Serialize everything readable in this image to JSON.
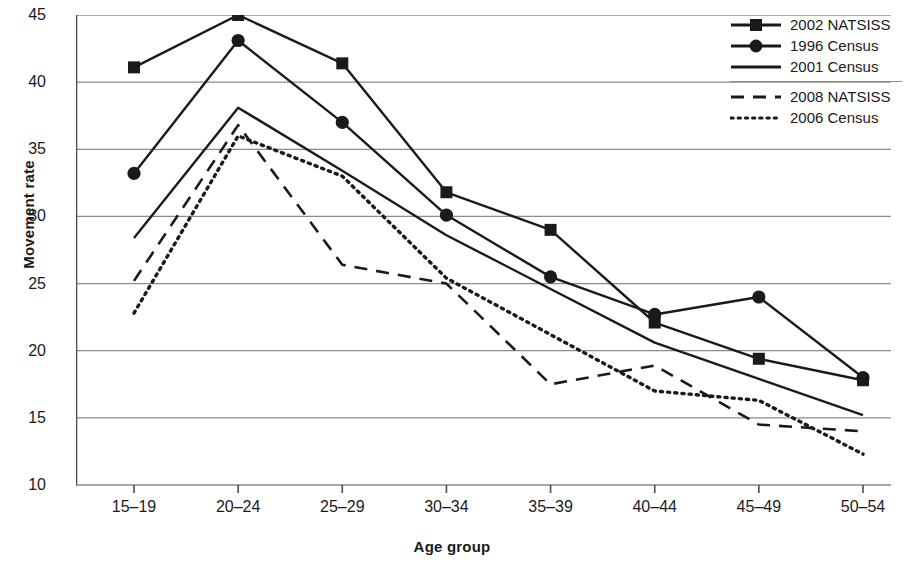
{
  "chart_data": {
    "type": "line",
    "title": "",
    "xlabel": "Age group",
    "ylabel": "Movement rate",
    "categories": [
      "15–19",
      "20–24",
      "25–29",
      "30–34",
      "35–39",
      "40–44",
      "45–49",
      "50–54"
    ],
    "ylim": [
      10,
      45
    ],
    "yticks": [
      10,
      15,
      20,
      25,
      30,
      35,
      40,
      45
    ],
    "grid": true,
    "legend_position": "top-right",
    "series": [
      {
        "name": "2002 NATSISS",
        "marker": "square",
        "dash": "solid",
        "values": [
          41.1,
          45.0,
          41.4,
          31.8,
          29.0,
          22.1,
          19.4,
          17.8
        ]
      },
      {
        "name": "1996 Census",
        "marker": "circle",
        "dash": "solid",
        "values": [
          33.2,
          43.1,
          37.0,
          30.1,
          25.5,
          22.7,
          24.0,
          18.0
        ]
      },
      {
        "name": "2001 Census",
        "marker": "none",
        "dash": "solid",
        "values": [
          28.4,
          38.1,
          33.4,
          28.6,
          24.6,
          20.6,
          17.9,
          15.2
        ]
      },
      {
        "name": "2008 NATSISS",
        "marker": "none",
        "dash": "dashed",
        "values": [
          25.2,
          36.8,
          26.4,
          25.0,
          17.5,
          18.9,
          14.5,
          14.0
        ]
      },
      {
        "name": "2006 Census",
        "marker": "none",
        "dash": "dotted",
        "values": [
          22.8,
          36.0,
          33.0,
          25.4,
          21.2,
          17.0,
          16.3,
          12.3
        ]
      }
    ]
  },
  "legend": {
    "groups": [
      {
        "items": [
          "2002 NATSISS",
          "1996 Census",
          "2001 Census"
        ]
      },
      {
        "items": [
          "2008 NATSISS",
          "2006 Census"
        ]
      }
    ]
  },
  "axis": {
    "y_title": "Movement rate",
    "x_title": "Age group",
    "ytick_labels": [
      "45",
      "40",
      "35",
      "30",
      "25",
      "20",
      "15",
      "10"
    ],
    "xtick_labels": [
      "15–19",
      "20–24",
      "25–29",
      "30–34",
      "35–39",
      "40–44",
      "45–49",
      "50–54"
    ]
  },
  "colors": {
    "ink": "#1a1a1a",
    "grid": "#8c8c8c",
    "background": "#ffffff"
  }
}
